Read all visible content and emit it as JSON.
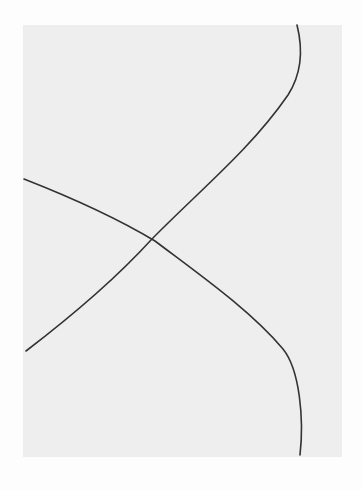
{
  "image": {
    "description": "Hand-drawn pencil sketch of two curved lines crossing on a gray sheet of paper",
    "paper_color": "#eeeeee",
    "background_color": "#fdfdfd",
    "line_color": "#333333",
    "lines": [
      {
        "name": "line-a",
        "path": "M297 25 C302 45 304 70 288 95 C250 150 200 190 151 240 C110 285 60 325 26 351"
      },
      {
        "name": "line-b",
        "path": "M24 179 C70 197 120 220 155 241 C200 275 250 310 283 349 C300 370 304 420 300 455"
      }
    ]
  }
}
